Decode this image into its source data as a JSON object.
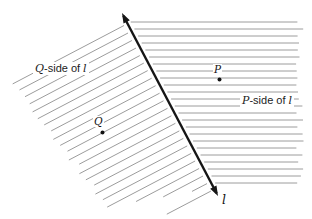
{
  "figure": {
    "labels": {
      "q_side": {
        "var1": "Q",
        "mid": "-side of",
        "var2": "l"
      },
      "p_side": {
        "var1": "P",
        "mid": "-side of",
        "var2": "l"
      },
      "point_p": "P",
      "point_q": "Q",
      "line_l": "l"
    },
    "colors": {
      "line": "#161616",
      "hatch": "#9c9c9c",
      "text": "#1c1c1c",
      "point": "#111111",
      "background": "#ffffff"
    },
    "geometry": {
      "canvas": {
        "width": 312,
        "height": 219
      },
      "line_l": {
        "x1": 122,
        "y1": 13,
        "x2": 218,
        "y2": 196,
        "stroke_width": 2.4,
        "arrow_len": 10,
        "arrow_half_width": 3.6
      },
      "points": {
        "p": {
          "x": 219.5,
          "y": 79.5,
          "r": 2
        },
        "q": {
          "x": 102.5,
          "y": 132.5,
          "r": 2
        }
      },
      "right_hatch": {
        "y_start": 22,
        "y_end": 184,
        "spacing": 7,
        "x_right": 304,
        "gap": 4,
        "stroke_width": 1
      },
      "left_hatch": {
        "t_start": 12,
        "t_end": 204,
        "spacing": 8.5,
        "gap": 4,
        "stroke_width": 1,
        "boundary": [
          [
            86,
            28
          ],
          [
            8,
            80
          ],
          [
            105,
            208
          ],
          [
            202,
            191
          ]
        ]
      }
    }
  }
}
